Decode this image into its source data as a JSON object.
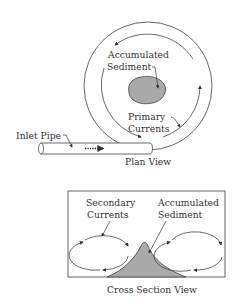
{
  "plan_view": {
    "caption": "Plan View",
    "labels": {
      "sediment_line1": "Accumulated",
      "sediment_line2": "Sediment",
      "currents_line1": "Primary",
      "currents_line2": "Currents",
      "inlet": "Inlet Pipe"
    }
  },
  "cross_section": {
    "caption": "Cross Section View",
    "labels": {
      "secondary_line1": "Secondary",
      "secondary_line2": "Currents",
      "sediment_line1": "Accumulated",
      "sediment_line2": "Sediment"
    }
  },
  "colors": {
    "line": "#444444",
    "sediment_fill": "#a9a9a9",
    "background": "#ffffff"
  }
}
